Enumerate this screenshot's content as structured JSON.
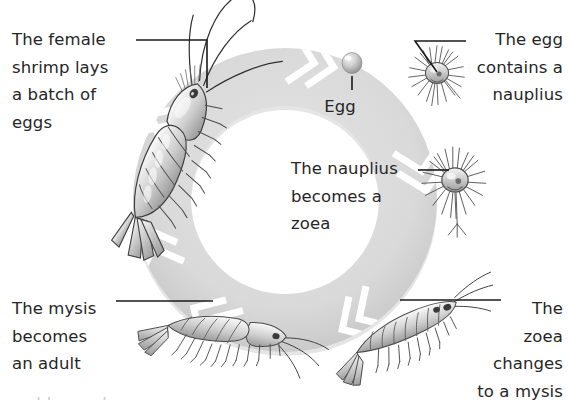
{
  "diagram": {
    "type": "cycle-diagram",
    "background_color": "#ffffff",
    "ring_color": "#dcdcdc",
    "ring_shadow_color": "#c4c4c4",
    "separator_color": "#ffffff",
    "text_color": "#262626",
    "leader_line_color": "#1a1a1a"
  },
  "labels": {
    "female_shrimp": "The female\nshrimp lays\na batch of\neggs",
    "egg": "Egg",
    "egg_contains_nauplius": "The egg\ncontains a\nnauplius",
    "nauplius_becomes_zoea": "The nauplius\nbecomes a\nzoea",
    "mysis_becomes_adult": "The mysis\nbecomes\nan adult",
    "zoea_changes_to_mysis": "The\nzoea\nchanges\nto a mysis"
  },
  "stages": [
    {
      "name": "egg",
      "label": "Egg",
      "position": "top-center"
    },
    {
      "name": "nauplius-in-egg",
      "label": "The egg contains a nauplius",
      "position": "top-right"
    },
    {
      "name": "nauplius",
      "label": "The nauplius becomes a zoea",
      "position": "right"
    },
    {
      "name": "zoea",
      "label": "The zoea changes to a mysis",
      "position": "bottom-right"
    },
    {
      "name": "mysis",
      "label": "The mysis becomes an adult",
      "position": "bottom-left"
    },
    {
      "name": "adult-female",
      "label": "The female shrimp lays a batch of eggs",
      "position": "left"
    }
  ],
  "bottom_crop": {
    "text": "clipped caption line"
  }
}
